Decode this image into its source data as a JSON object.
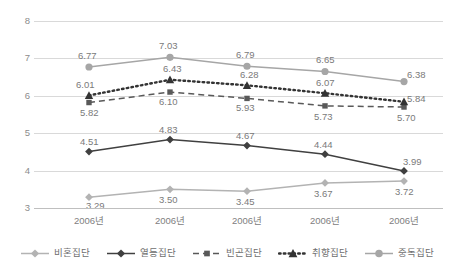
{
  "chart_data": {
    "type": "line",
    "title": "",
    "xlabel": "",
    "ylabel": "",
    "ylim": [
      3,
      8
    ],
    "yticks": [
      "8",
      "7",
      "6",
      "5",
      "4",
      "3"
    ],
    "grid": true,
    "legend_position": "bottom",
    "categories": [
      "2006년",
      "2006년",
      "2006년",
      "2006년",
      "2006년"
    ],
    "series": [
      {
        "name": "비혼집단",
        "marker": "diamond",
        "line_style": "solid",
        "color": "#b3b3b3",
        "values": [
          3.29,
          3.5,
          3.45,
          3.67,
          3.72
        ],
        "labels": [
          "3.29",
          "3.50",
          "3.45",
          "3.67",
          "3.72"
        ]
      },
      {
        "name": "열등집단",
        "marker": "diamond",
        "line_style": "solid",
        "color": "#404040",
        "values": [
          4.51,
          4.83,
          4.67,
          4.44,
          3.99
        ],
        "labels": [
          "4.51",
          "4.83",
          "4.67",
          "4.44",
          "3.99"
        ]
      },
      {
        "name": "빈곤집단",
        "marker": "square",
        "line_style": "dashed",
        "color": "#595959",
        "values": [
          5.82,
          6.1,
          5.93,
          5.73,
          5.7
        ],
        "labels": [
          "5.82",
          "6.10",
          "5.93",
          "5.73",
          "5.70"
        ]
      },
      {
        "name": "취향집단",
        "marker": "triangle",
        "line_style": "dotted",
        "color": "#333333",
        "values": [
          6.01,
          6.43,
          6.28,
          6.07,
          5.84
        ],
        "labels": [
          "6.01",
          "6.43",
          "6.28",
          "6.07",
          "5.84"
        ]
      },
      {
        "name": "중독집단",
        "marker": "circle",
        "line_style": "solid",
        "color": "#a6a6a6",
        "values": [
          6.77,
          7.03,
          6.79,
          6.65,
          6.38
        ],
        "labels": [
          "6.77",
          "7.03",
          "6.79",
          "6.65",
          "6.38"
        ]
      }
    ]
  },
  "legend": {
    "items": [
      {
        "label": "비혼집단"
      },
      {
        "label": "열등집단"
      },
      {
        "label": "빈곤집단"
      },
      {
        "label": "취향집단"
      },
      {
        "label": "중독집단"
      }
    ]
  }
}
